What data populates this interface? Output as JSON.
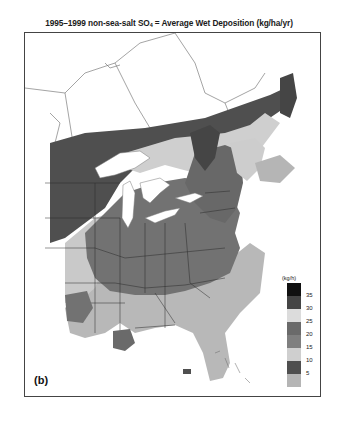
{
  "title": {
    "prefix": "1995–1999 non-sea-salt SO",
    "subscript": "4",
    "suffix": " = Average Wet Deposition (kg/ha/yr)"
  },
  "panel_label": "(b)",
  "legend": {
    "unit": "(kg/h)",
    "bins": [
      {
        "range": ">35",
        "color": "#111111"
      },
      {
        "range": "30-35",
        "color": "#454545"
      },
      {
        "range": "25-30",
        "color": "#dcdcdc"
      },
      {
        "range": "20-25",
        "color": "#6a6a6a"
      },
      {
        "range": "15-20",
        "color": "#7f7f7f"
      },
      {
        "range": "10-15",
        "color": "#cfcfcf"
      },
      {
        "range": "5-10",
        "color": "#4f4f4f"
      },
      {
        "range": "<5",
        "color": "#b5b5b5"
      }
    ],
    "ticks": [
      "35",
      "30",
      "25",
      "20",
      "15",
      "10",
      "5"
    ]
  },
  "colors": {
    "background": "#ffffff",
    "water": "#ffffff",
    "border": "#333333"
  }
}
